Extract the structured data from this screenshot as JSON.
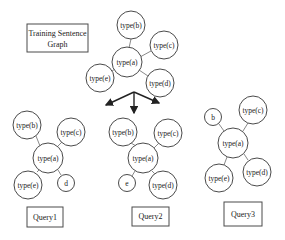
{
  "title_box": {
    "line1": "Training Sentence",
    "line2": "Graph"
  },
  "training_graph": {
    "nodes": [
      {
        "id": "a",
        "label": "type(a)"
      },
      {
        "id": "b",
        "label": "type(b)"
      },
      {
        "id": "c",
        "label": "type(c)"
      },
      {
        "id": "d",
        "label": "type(d)"
      },
      {
        "id": "e",
        "label": "type(e)"
      }
    ]
  },
  "queries": [
    {
      "label": "Query1",
      "nodes": [
        {
          "id": "a",
          "label": "type(a)"
        },
        {
          "id": "b",
          "label": "type(b)"
        },
        {
          "id": "c",
          "label": "type(c)"
        },
        {
          "id": "e",
          "label": "type(e)"
        },
        {
          "id": "d",
          "label": "d"
        }
      ]
    },
    {
      "label": "Query2",
      "nodes": [
        {
          "id": "a",
          "label": "type(a)"
        },
        {
          "id": "b",
          "label": "type(b)"
        },
        {
          "id": "c",
          "label": "type(c)"
        },
        {
          "id": "e",
          "label": "e"
        },
        {
          "id": "d",
          "label": "type(d)"
        }
      ]
    },
    {
      "label": "Query3",
      "nodes": [
        {
          "id": "a",
          "label": "type(a)"
        },
        {
          "id": "b",
          "label": "b"
        },
        {
          "id": "c",
          "label": "type(c)"
        },
        {
          "id": "e",
          "label": "type(e)"
        },
        {
          "id": "d",
          "label": "type(d)"
        }
      ]
    }
  ]
}
